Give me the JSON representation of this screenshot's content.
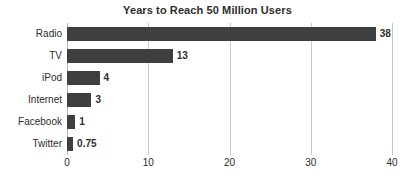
{
  "chart_data": {
    "type": "bar",
    "orientation": "horizontal",
    "title": "Years to Reach 50 Million Users",
    "xlabel": "",
    "ylabel": "",
    "categories": [
      "Radio",
      "TV",
      "iPod",
      "Internet",
      "Facebook",
      "Twitter"
    ],
    "values": [
      38,
      13,
      4,
      3,
      1,
      0.75
    ],
    "value_labels": [
      "38",
      "13",
      "4",
      "3",
      "1",
      "0.75"
    ],
    "xlim": [
      0,
      40
    ],
    "xticks": [
      0,
      10,
      20,
      30,
      40
    ],
    "xtick_labels": [
      "0",
      "10",
      "20",
      "30",
      "40"
    ],
    "grid": "vertical",
    "legend": "none",
    "bar_color": "#3f3f3f",
    "gridline_color": "#c9c9c9",
    "text_color": "#2b2b2b",
    "background_color": "#ffffff"
  }
}
